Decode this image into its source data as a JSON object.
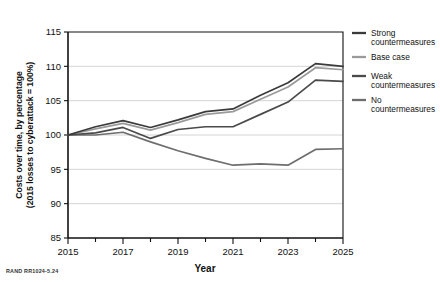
{
  "figure": {
    "credit": "RAND RR1024-5.24"
  },
  "chart_data": {
    "type": "line",
    "title": "",
    "xlabel": "Year",
    "ylabel": "Costs over time, by percentage (2015 losses to cyberattack = 100%)",
    "ylabel_line1": "Costs over time, by percentage",
    "ylabel_line2": "(2015 losses to cyberattack = 100%)",
    "xlim": [
      2015,
      2025
    ],
    "ylim": [
      85,
      115
    ],
    "grid": true,
    "grid_axis": "y",
    "legend_position": "right",
    "x": [
      2015,
      2016,
      2017,
      2018,
      2019,
      2020,
      2021,
      2022,
      2023,
      2024,
      2025
    ],
    "xticks": [
      2015,
      2016,
      2017,
      2018,
      2019,
      2020,
      2021,
      2022,
      2023,
      2024,
      2025
    ],
    "xticklabels": [
      "2015",
      "",
      "2017",
      "",
      "2019",
      "",
      "2021",
      "",
      "2023",
      "",
      "2025"
    ],
    "yticks": [
      85,
      90,
      95,
      100,
      105,
      110,
      115
    ],
    "yticklabels": [
      "85",
      "90",
      "95",
      "100",
      "105",
      "110",
      "115"
    ],
    "series": [
      {
        "name": "Strong countermeasures",
        "legend_label_line1": "Strong",
        "legend_label_line2": "countermeasures",
        "color": "#3a3a3a",
        "values": [
          100.0,
          101.2,
          102.1,
          101.1,
          102.2,
          103.4,
          103.8,
          105.8,
          107.6,
          110.4,
          110.0
        ]
      },
      {
        "name": "Base case",
        "legend_label_line1": "Base case",
        "legend_label_line2": "",
        "color": "#9a9a9a",
        "values": [
          100.0,
          100.9,
          101.7,
          100.7,
          101.8,
          103.0,
          103.4,
          105.2,
          107.0,
          109.8,
          109.5
        ]
      },
      {
        "name": "Weak countermeasures",
        "legend_label_line1": "Weak",
        "legend_label_line2": "countermeasures",
        "color": "#4a4a4a",
        "values": [
          100.0,
          100.3,
          101.1,
          99.5,
          100.8,
          101.2,
          101.2,
          103.0,
          104.8,
          108.0,
          107.8
        ]
      },
      {
        "name": "No countermeasures",
        "legend_label_line1": "No",
        "legend_label_line2": "countermeasures",
        "color": "#6e6e6e",
        "values": [
          100.0,
          100.0,
          100.4,
          99.0,
          97.7,
          96.6,
          95.6,
          95.8,
          95.6,
          97.9,
          98.0
        ]
      }
    ]
  }
}
